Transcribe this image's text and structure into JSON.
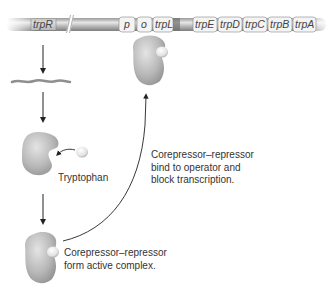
{
  "diagram": {
    "dna": {
      "regulator_gene": "trpR",
      "operon_segments": [
        "p",
        "o",
        "trpL",
        "trpE",
        "trpD",
        "trpC",
        "trpB",
        "trpA"
      ]
    },
    "labels": {
      "tryptophan": "Tryptophan",
      "complex_line1": "Corepressor–repressor",
      "complex_line2": "form active complex.",
      "bind_line1": "Corepressor–repressor",
      "bind_line2": "bind to operator and",
      "bind_line3": "block transcription."
    },
    "colors": {
      "dna_dark": "#8a8a8a",
      "dna_light": "#d8d8d8",
      "segment_fill": "#f2f2f2",
      "protein": "#b5b5b5",
      "arrow": "#222222",
      "text": "#333333"
    }
  }
}
